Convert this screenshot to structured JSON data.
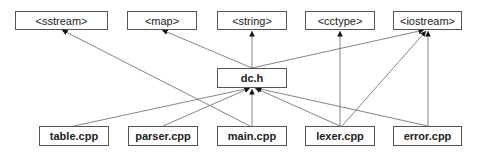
{
  "diagram": {
    "type": "include-dependency-graph",
    "nodes": {
      "sstream": {
        "label": "<sstream>"
      },
      "map": {
        "label": "<map>"
      },
      "string": {
        "label": "<string>"
      },
      "cctype": {
        "label": "<cctype>"
      },
      "iostream": {
        "label": "<iostream>"
      },
      "dc_h": {
        "label": "dc.h"
      },
      "table": {
        "label": "table.cpp"
      },
      "parser": {
        "label": "parser.cpp"
      },
      "main": {
        "label": "main.cpp"
      },
      "lexer": {
        "label": "lexer.cpp"
      },
      "error": {
        "label": "error.cpp"
      }
    },
    "edges": [
      {
        "from": "table.cpp",
        "to": "dc.h"
      },
      {
        "from": "parser.cpp",
        "to": "dc.h"
      },
      {
        "from": "main.cpp",
        "to": "dc.h"
      },
      {
        "from": "lexer.cpp",
        "to": "dc.h"
      },
      {
        "from": "error.cpp",
        "to": "dc.h"
      },
      {
        "from": "main.cpp",
        "to": "<sstream>"
      },
      {
        "from": "dc.h",
        "to": "<map>"
      },
      {
        "from": "dc.h",
        "to": "<string>"
      },
      {
        "from": "dc.h",
        "to": "<iostream>"
      },
      {
        "from": "lexer.cpp",
        "to": "<cctype>"
      },
      {
        "from": "lexer.cpp",
        "to": "<iostream>"
      },
      {
        "from": "error.cpp",
        "to": "<iostream>"
      }
    ],
    "colors": {
      "line": "#555555",
      "border": "#555555",
      "text": "#222222",
      "background": "#ffffff"
    }
  }
}
